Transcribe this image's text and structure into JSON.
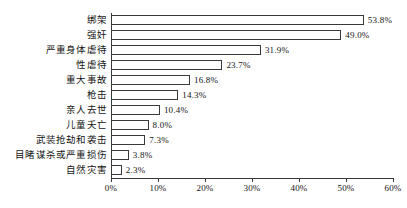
{
  "chart_data": {
    "type": "bar",
    "orientation": "horizontal",
    "title": "",
    "subtitle": "",
    "xlabel": "",
    "ylabel": "",
    "xlim": [
      0,
      60
    ],
    "grid": false,
    "legend": false,
    "legend_position": "none",
    "bar_style": {
      "fill": "#ffffff",
      "edge": "#3a3a3a"
    },
    "xticks": [
      "0%",
      "10%",
      "20%",
      "30%",
      "40%",
      "50%",
      "60%"
    ],
    "xtick_values": [
      0,
      10,
      20,
      30,
      40,
      50,
      60
    ],
    "categories": [
      "绑架",
      "强奸",
      "严重身体虐待",
      "性虐待",
      "重大事故",
      "枪击",
      "亲人去世",
      "儿童夭亡",
      "武装抢劫和袭击",
      "目睹谋杀或严重损伤",
      "自然灾害"
    ],
    "values": [
      53.8,
      49.0,
      31.9,
      23.7,
      16.8,
      14.3,
      10.4,
      8.0,
      7.3,
      3.8,
      2.3
    ],
    "value_labels": [
      "53.8%",
      "49.0%",
      "31.9%",
      "23.7%",
      "16.8%",
      "14.3%",
      "10.4%",
      "8.0%",
      "7.3%",
      "3.8%",
      "2.3%"
    ]
  }
}
